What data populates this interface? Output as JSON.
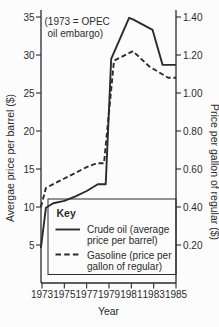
{
  "figure": {
    "background": "#fcfcfc",
    "annotation": {
      "line1": "(1973 = OPEC",
      "line2": "oil embargo)"
    },
    "key": {
      "title": "Key",
      "items": [
        {
          "id": "crude-oil",
          "line_style": "solid",
          "lines": [
            "Crude oil (average",
            "price per barrel)"
          ]
        },
        {
          "id": "gasoline",
          "line_style": "dashed",
          "lines": [
            "Gasoline (price per",
            "gallon of regular)"
          ]
        }
      ]
    }
  },
  "chart_data": {
    "type": "line",
    "title": "",
    "annotation": "(1973 = OPEC oil embargo)",
    "xlabel": "Year",
    "grid": false,
    "legend_position": "inside-bottom",
    "x_axis": {
      "ticks": [
        "1973",
        "1975",
        "1977",
        "1979",
        "1981",
        "1983",
        "1985"
      ],
      "tick_values": [
        1973,
        1975,
        1977,
        1979,
        1981,
        1983,
        1985
      ],
      "range": [
        1973,
        1985
      ]
    },
    "left_axis": {
      "label": "Avergae price per barrel ($)",
      "ticks": [
        "35",
        "30",
        "25",
        "20",
        "15",
        "10",
        "5"
      ],
      "tick_values": [
        35,
        30,
        25,
        20,
        15,
        10,
        5
      ],
      "range": [
        0,
        36.5
      ]
    },
    "right_axis": {
      "label": "Price per gallon of regular ($)",
      "ticks": [
        "1.40",
        "1.20",
        "1.00",
        "0.80",
        "0.60",
        "0.40",
        "0.20"
      ],
      "tick_values": [
        1.4,
        1.2,
        1.0,
        0.8,
        0.6,
        0.4,
        0.2
      ],
      "range": [
        0,
        1.46
      ]
    },
    "series": [
      {
        "name": "Crude oil (average price per barrel)",
        "axis": "left",
        "style": "solid",
        "points": [
          [
            1972.9,
            4.6
          ],
          [
            1973.35,
            9.9
          ],
          [
            1974,
            10.5
          ],
          [
            1975,
            10.8
          ],
          [
            1976,
            11.4
          ],
          [
            1977,
            12.1
          ],
          [
            1978,
            13.0
          ],
          [
            1978.7,
            13.0
          ],
          [
            1979.2,
            29.5
          ],
          [
            1980.8,
            34.9
          ],
          [
            1981.15,
            34.7
          ],
          [
            1982.9,
            33.3
          ],
          [
            1983.8,
            28.7
          ],
          [
            1985,
            28.7
          ]
        ]
      },
      {
        "name": "Gasoline (price per gallon of regular)",
        "axis": "right",
        "style": "dashed",
        "points": [
          [
            1972.9,
            0.4
          ],
          [
            1973.35,
            0.5
          ],
          [
            1974,
            0.52
          ],
          [
            1975,
            0.55
          ],
          [
            1976,
            0.58
          ],
          [
            1977,
            0.61
          ],
          [
            1977.9,
            0.63
          ],
          [
            1978.55,
            0.63
          ],
          [
            1979.45,
            1.17
          ],
          [
            1981.15,
            1.22
          ],
          [
            1982.6,
            1.14
          ],
          [
            1984.3,
            1.08
          ],
          [
            1985,
            1.08
          ]
        ]
      }
    ]
  },
  "colors": {
    "ink": "#2b2b2b",
    "background": "#fcfcfc"
  }
}
